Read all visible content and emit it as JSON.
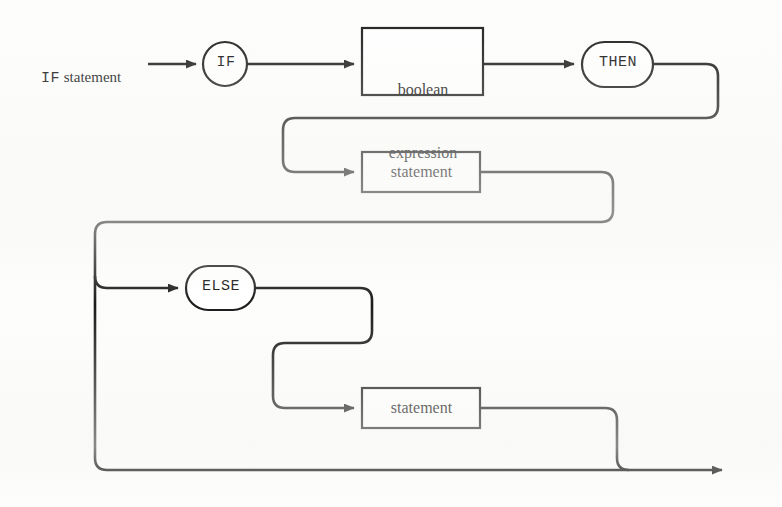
{
  "diagram": {
    "title": "IF statement",
    "type": "railroad-syntax-diagram",
    "entry": {
      "keyword_part": "IF",
      "nonterminal_part": " statement"
    },
    "nodes": {
      "if_terminal": "IF",
      "boolean_expression": "boolean\nexpression",
      "boolean_expression_line1": "boolean",
      "boolean_expression_line2": "expression",
      "then_terminal": "THEN",
      "then_statement": "statement",
      "else_terminal": "ELSE",
      "else_statement": "statement"
    },
    "colors": {
      "line": "#1b1b1b",
      "box_fill": "#ffffff",
      "box_stroke": "#1b1b1b",
      "text": "#111111",
      "page_background": "#fdfdfc"
    },
    "geometry": {
      "width": 782,
      "height": 507,
      "row_y": [
        64,
        172,
        288,
        408,
        470
      ],
      "stroke_width": 2.6
    }
  }
}
